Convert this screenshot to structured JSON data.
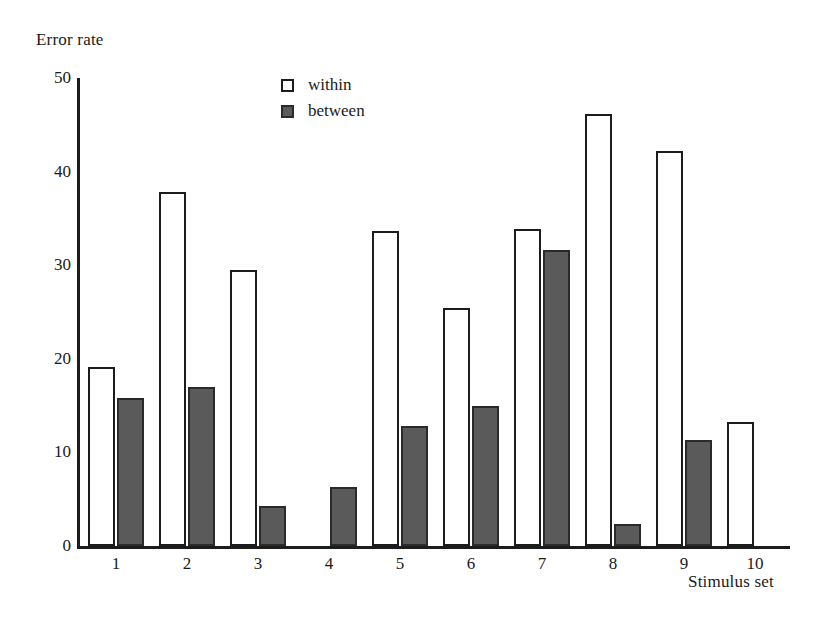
{
  "chart_data": {
    "type": "bar",
    "title": "",
    "xlabel": "Stimulus set",
    "ylabel": "Error rate",
    "categories": [
      "1",
      "2",
      "3",
      "4",
      "5",
      "6",
      "7",
      "8",
      "9",
      "10"
    ],
    "ylim": [
      0,
      50
    ],
    "yticks": [
      0,
      10,
      20,
      30,
      40,
      50
    ],
    "grid": false,
    "legend_position": "top-center",
    "series": [
      {
        "name": "within",
        "fill": "#ffffff",
        "stroke": "#1c1c1c",
        "values": [
          19.1,
          37.8,
          29.5,
          null,
          33.7,
          25.4,
          33.9,
          46.2,
          42.2,
          13.2
        ]
      },
      {
        "name": "between",
        "fill": "#5a5a5a",
        "stroke": "#2a2a2a",
        "values": [
          15.8,
          17.0,
          4.3,
          6.3,
          12.8,
          15.0,
          31.6,
          2.4,
          11.3,
          null
        ]
      }
    ]
  },
  "legend": {
    "items": [
      {
        "label": "within",
        "swatch": "hollow-square-icon"
      },
      {
        "label": "between",
        "swatch": "filled-square-icon"
      }
    ]
  },
  "axes": {
    "y_title": "Error rate",
    "x_title": "Stimulus set"
  }
}
